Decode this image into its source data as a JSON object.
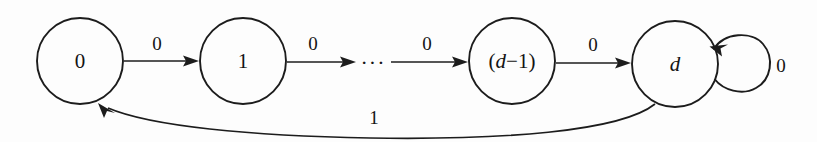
{
  "diagram": {
    "type": "state-machine",
    "background_color": "#fdfdfd",
    "stroke_color": "#1c1c1c",
    "states": [
      {
        "id": "s0",
        "label": "0",
        "italic": false,
        "cx": 80,
        "cy": 61,
        "r": 43
      },
      {
        "id": "s1",
        "label": "1",
        "italic": false,
        "cx": 243,
        "cy": 61,
        "r": 43
      },
      {
        "id": "sd1",
        "label_paren_open": "(",
        "label_var": "d",
        "label_op": "−",
        "label_num": "1",
        "label_paren_close": ")",
        "italic": true,
        "cx": 512,
        "cy": 61,
        "r": 43
      },
      {
        "id": "sd",
        "label": "d",
        "italic": true,
        "cx": 675,
        "cy": 64,
        "r": 43
      }
    ],
    "ellipsis": {
      "text": "···",
      "x": 373,
      "y": 63
    },
    "transitions": [
      {
        "id": "t0",
        "from": "s0",
        "to": "s1",
        "label": "0",
        "label_x": 157,
        "label_y": 43
      },
      {
        "id": "t1",
        "from": "s1",
        "to": "ellipsis",
        "label": "0",
        "label_x": 313,
        "label_y": 43
      },
      {
        "id": "t2",
        "from": "ellipsis",
        "to": "sd1",
        "label": "0",
        "label_x": 427,
        "label_y": 43
      },
      {
        "id": "t3",
        "from": "sd1",
        "to": "sd",
        "label": "0",
        "label_x": 593,
        "label_y": 44
      },
      {
        "id": "t4",
        "from": "sd",
        "to": "sd",
        "label": "0",
        "label_x": 781,
        "label_y": 65,
        "kind": "self-loop"
      },
      {
        "id": "t5",
        "from": "sd",
        "to": "s0",
        "label": "1",
        "label_x": 374,
        "label_y": 117,
        "kind": "return-curve"
      }
    ]
  }
}
